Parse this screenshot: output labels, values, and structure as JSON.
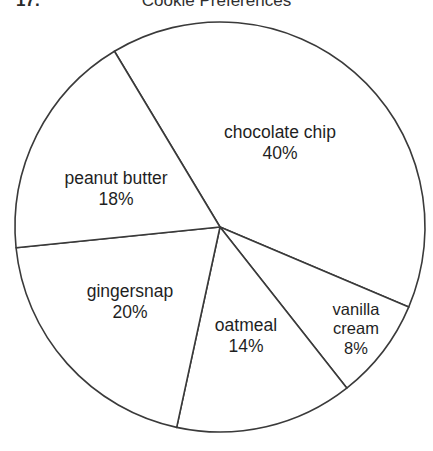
{
  "header": {
    "item_number": "17.",
    "title": "Cookie Preferences"
  },
  "chart_data": {
    "type": "pie",
    "title": "Cookie Preferences",
    "xlabel": "",
    "ylabel": "",
    "legend": "none",
    "grid": false,
    "unit": "%",
    "total": 100,
    "start_angle_deg": 121,
    "direction": "clockwise",
    "center": [
      220,
      227
    ],
    "radius": 205,
    "stroke_color": "#3a3a3a",
    "fill_color": "#ffffff",
    "categories": [
      "chocolate chip",
      "vanilla cream",
      "oatmeal",
      "gingersnap",
      "peanut butter"
    ],
    "values": [
      40,
      8,
      14,
      20,
      18
    ],
    "slices": [
      {
        "name": "chocolate chip",
        "value": 40,
        "value_label": "40%",
        "label_lines": [
          "chocolate chip",
          "40%"
        ],
        "sweep_deg": 144
      },
      {
        "name": "vanilla cream",
        "value": 8,
        "value_label": "8%",
        "label_lines": [
          "vanilla",
          "cream",
          "8%"
        ],
        "sweep_deg": 28.8
      },
      {
        "name": "oatmeal",
        "value": 14,
        "value_label": "14%",
        "label_lines": [
          "oatmeal",
          "14%"
        ],
        "sweep_deg": 50.4
      },
      {
        "name": "gingersnap",
        "value": 20,
        "value_label": "20%",
        "label_lines": [
          "gingersnap",
          "20%"
        ],
        "sweep_deg": 72
      },
      {
        "name": "peanut butter",
        "value": 18,
        "value_label": "18%",
        "label_lines": [
          "peanut butter",
          "18%"
        ],
        "sweep_deg": 64.8
      }
    ]
  },
  "labels": {
    "chocolate_chip": {
      "name": "chocolate chip",
      "value": "40%"
    },
    "peanut_butter": {
      "name": "peanut butter",
      "value": "18%"
    },
    "gingersnap": {
      "name": "gingersnap",
      "value": "20%"
    },
    "oatmeal": {
      "name": "oatmeal",
      "value": "14%"
    },
    "vanilla_cream": {
      "name1": "vanilla",
      "name2": "cream",
      "value": "8%"
    }
  }
}
